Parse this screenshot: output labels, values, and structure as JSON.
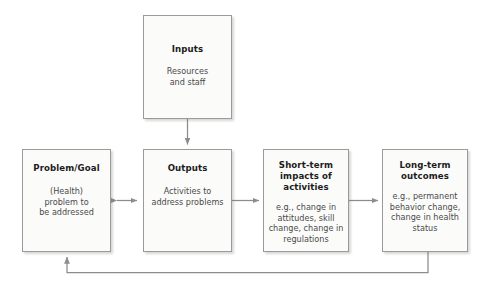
{
  "diagram": {
    "type": "flow-diagram",
    "background_color": "#ffffff",
    "node_fill_color": "#fbfbfa",
    "node_border_color": "#9a9a9a",
    "connector_color": "#8c8c8c",
    "title_text_color": "#1c1c1c",
    "body_text_color": "#4a4a4a"
  },
  "nodes": {
    "inputs": {
      "title": "Inputs",
      "body": "Resources\nand staff"
    },
    "problem": {
      "title": "Problem/Goal",
      "body": "(Health)\nproblem to\nbe addressed"
    },
    "outputs": {
      "title": "Outputs",
      "body": "Activities to\naddress problems"
    },
    "short_term": {
      "title": "Short-term\nimpacts of\nactivities",
      "body": "e.g., change in\nattitudes, skill\nchange, change in\nregulations"
    },
    "long_term": {
      "title": "Long-term\noutcomes",
      "body": "e.g., permanent\nbehavior change,\nchange in health\nstatus"
    }
  },
  "connectors": [
    {
      "id": "inputs-to-outputs",
      "from": "inputs",
      "to": "outputs",
      "direction": "down",
      "arrowheads": "single"
    },
    {
      "id": "problem-outputs-bidirectional",
      "from": "problem",
      "to": "outputs",
      "direction": "horizontal",
      "arrowheads": "double"
    },
    {
      "id": "outputs-to-short-term",
      "from": "outputs",
      "to": "short_term",
      "direction": "right",
      "arrowheads": "single"
    },
    {
      "id": "short-term-to-long-term",
      "from": "short_term",
      "to": "long_term",
      "direction": "right",
      "arrowheads": "single"
    },
    {
      "id": "feedback-loop",
      "from": "long_term",
      "to": "problem",
      "direction": "feedback",
      "arrowheads": "single"
    }
  ]
}
